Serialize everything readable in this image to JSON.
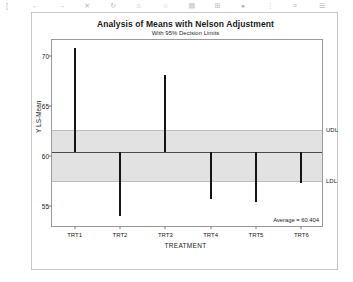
{
  "toolbar": {
    "items": [
      "[",
      "←",
      "→",
      "✕",
      "↻",
      "⌂",
      "☆",
      "▤",
      "⊞",
      "●",
      "⋮",
      "≡",
      "☰"
    ]
  },
  "chart_data": {
    "type": "bar",
    "title": "Analysis of Means with Nelson Adjustment",
    "subtitle": "With 95% Decision Limits",
    "xlabel": "TREATMENT",
    "ylabel": "Y LS-Mean",
    "categories": [
      "TRT1",
      "TRT2",
      "TRT3",
      "TRT4",
      "TRT5",
      "TRT6"
    ],
    "values": [
      70.8,
      54.0,
      68.1,
      55.7,
      55.4,
      57.3
    ],
    "ylim": [
      52.8,
      71.6
    ],
    "yticks": [
      70,
      65,
      60,
      55
    ],
    "ytick_labels": [
      "70",
      "65",
      "60",
      "55"
    ],
    "center_line": 60.404,
    "upper_decision_limit": 62.6,
    "lower_decision_limit": 57.5,
    "udl_label": "UDL",
    "ldl_label": "LDL",
    "average_annotation": "Average = 60.404",
    "grid": false,
    "legend": "none",
    "band_color": "#e2e2e2",
    "bar_color": "#151515",
    "center_line_color": "#4a4a4a"
  }
}
